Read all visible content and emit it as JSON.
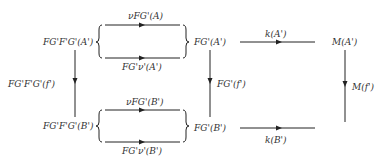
{
  "nodes": {
    "fgfg_a": "FG'F'G'(A')",
    "fg_a": "FG'(A')",
    "m_a": "M(A')",
    "fgfg_b": "FG'F'G'(B')",
    "fg_b": "FG'(B')",
    "m_b": ""
  },
  "arrows": {
    "top_upper": "νFG'(A)",
    "top_lower": "FG'ν'(A')",
    "k_a": "k(A')",
    "left_vertical": "FG'F'G'(f')",
    "mid_vertical": "FG'(f')",
    "right_vertical": "M(f')",
    "bot_upper": "νFG'(B')",
    "bot_lower": "FG'ν'(B')",
    "k_b": "k(B')"
  },
  "colors": {
    "line": "#222222",
    "text": "#333333"
  }
}
